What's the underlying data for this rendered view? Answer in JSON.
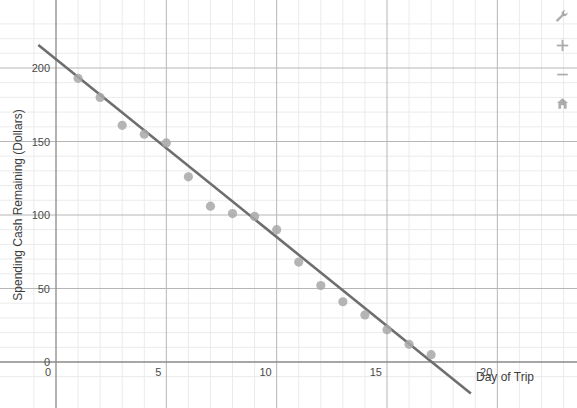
{
  "chart_data": {
    "type": "scatter",
    "title": "",
    "xlabel": "Day of Trip",
    "ylabel": "Spending Cash Remaining (Dollars)",
    "xlim": [
      -1.1,
      23.5
    ],
    "ylim": [
      -13,
      238
    ],
    "xticks": [
      0,
      5,
      10,
      15,
      20
    ],
    "xtick_labels": [
      "0",
      "5",
      "10",
      "15",
      "20"
    ],
    "yticks": [
      0,
      50,
      100,
      150,
      200
    ],
    "ytick_labels": [
      "0",
      "50",
      "100",
      "150",
      "200"
    ],
    "grid": true,
    "minor_grid": true,
    "legend": "none",
    "point_color": "#a8a8a8",
    "line_color": "#6e6e6e",
    "grid_color": "#b6b6b6",
    "minor_grid_color": "#ebebeb",
    "axis_color": "#8a8a8a",
    "points": [
      {
        "x": 1,
        "y": 193
      },
      {
        "x": 2,
        "y": 180
      },
      {
        "x": 3,
        "y": 161
      },
      {
        "x": 4,
        "y": 155
      },
      {
        "x": 5,
        "y": 149
      },
      {
        "x": 6,
        "y": 126
      },
      {
        "x": 7,
        "y": 106
      },
      {
        "x": 8,
        "y": 101
      },
      {
        "x": 9,
        "y": 99
      },
      {
        "x": 10,
        "y": 90
      },
      {
        "x": 11,
        "y": 68
      },
      {
        "x": 12,
        "y": 52
      },
      {
        "x": 13,
        "y": 41
      },
      {
        "x": 14,
        "y": 32
      },
      {
        "x": 15,
        "y": 22
      },
      {
        "x": 16,
        "y": 12
      },
      {
        "x": 17,
        "y": 5
      }
    ],
    "trendline": {
      "type": "line",
      "slope": -12.1,
      "intercept": 206,
      "x_start": -0.8,
      "x_end": 18.8,
      "y_start": 215.7,
      "y_end": -21.5
    }
  },
  "toolbar": {
    "items": [
      {
        "name": "settings-wrench",
        "icon": "wrench-icon",
        "label": "Settings"
      },
      {
        "name": "zoom-in",
        "icon": "plus-icon",
        "label": "+"
      },
      {
        "name": "zoom-out",
        "icon": "minus-icon",
        "label": "−"
      },
      {
        "name": "reset-home",
        "icon": "home-icon",
        "label": "Home"
      }
    ]
  }
}
